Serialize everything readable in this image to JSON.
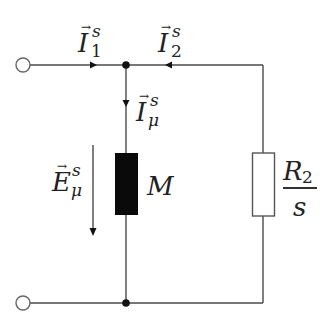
{
  "diagram": {
    "type": "equivalent circuit",
    "colors": {
      "wire": "#4a4a4a",
      "node": "#111111",
      "main_inductance_block": "#0a0a0a",
      "resistor_fill": "#ffffff",
      "background": "#ffffff"
    },
    "labels": {
      "I1": {
        "base": "I",
        "vector": "→",
        "sup": "s",
        "sub": "1"
      },
      "I2": {
        "base": "I",
        "vector": "→",
        "sup": "s",
        "sub": "2"
      },
      "Imu": {
        "base": "I",
        "vector": "→",
        "sup": "s",
        "sub": "μ"
      },
      "Emu": {
        "base": "E",
        "vector": "→",
        "sup": "s",
        "sub": "μ"
      },
      "M": "M",
      "R2_over_s": {
        "numerator_base": "R",
        "numerator_sub": "2",
        "denominator": "s"
      }
    },
    "components": [
      {
        "id": "terminal-top",
        "kind": "open terminal"
      },
      {
        "id": "terminal-bottom",
        "kind": "open terminal"
      },
      {
        "id": "node-top",
        "kind": "junction"
      },
      {
        "id": "node-bottom",
        "kind": "junction"
      },
      {
        "id": "M",
        "kind": "main inductance (filled block)"
      },
      {
        "id": "R2/s",
        "kind": "resistor"
      }
    ]
  }
}
